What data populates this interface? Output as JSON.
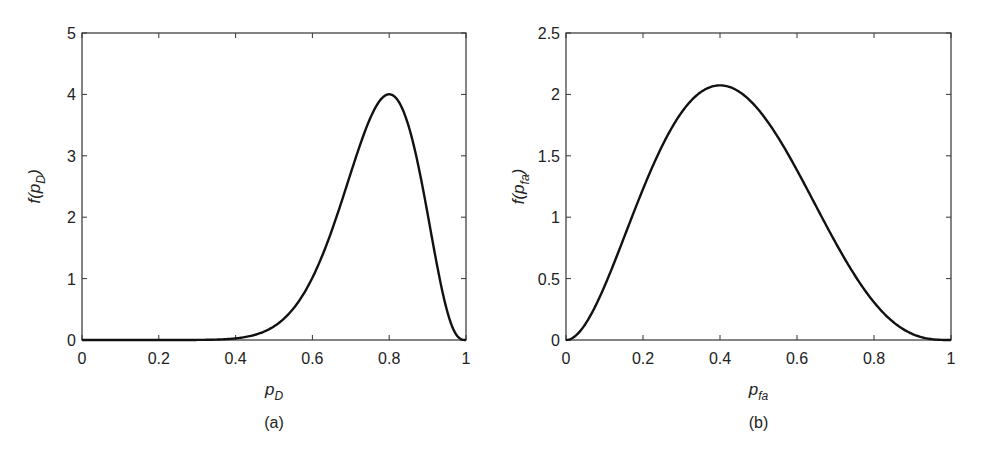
{
  "chart_data": [
    {
      "type": "line",
      "panel_label": "(a)",
      "title": "",
      "xlabel": "p_D",
      "xlabel_main": "p",
      "xlabel_sub": "D",
      "ylabel": "f(p_D)",
      "ylabel_prefix": "f(p",
      "ylabel_sub": "D",
      "ylabel_suffix": ")",
      "xlim": [
        0,
        1
      ],
      "ylim": [
        0,
        5
      ],
      "xticks": [
        0,
        0.2,
        0.4,
        0.6,
        0.8,
        1
      ],
      "xtick_labels": [
        "0",
        "0.2",
        "0.4",
        "0.6",
        "0.8",
        "1"
      ],
      "yticks": [
        0,
        1,
        2,
        3,
        4,
        5
      ],
      "ytick_labels": [
        "0",
        "1",
        "2",
        "3",
        "4",
        "5"
      ],
      "grid": false,
      "legend": null,
      "series": [
        {
          "name": "Beta(13,4) pdf",
          "distribution": {
            "family": "beta",
            "alpha": 13,
            "beta": 4
          },
          "x": [
            0,
            0.1,
            0.2,
            0.3,
            0.4,
            0.45,
            0.5,
            0.55,
            0.6,
            0.65,
            0.7,
            0.75,
            0.8,
            0.85,
            0.9,
            0.95,
            1.0
          ],
          "values": [
            0,
            0.0,
            0.0,
            0.0,
            0.05,
            0.12,
            0.27,
            0.53,
            0.96,
            1.61,
            2.42,
            3.27,
            4.0,
            4.2,
            3.0,
            1.08,
            0
          ]
        }
      ],
      "annotations": {
        "peak": {
          "x": 0.8,
          "y": 4.0
        }
      }
    },
    {
      "type": "line",
      "panel_label": "(b)",
      "title": "",
      "xlabel": "p_fa",
      "xlabel_main": "p",
      "xlabel_sub": "fa",
      "ylabel": "f(p_fa)",
      "ylabel_prefix": "f(p",
      "ylabel_sub": "fa",
      "ylabel_suffix": ")",
      "xlim": [
        0,
        1
      ],
      "ylim": [
        0,
        2.5
      ],
      "xticks": [
        0,
        0.2,
        0.4,
        0.6,
        0.8,
        1
      ],
      "xtick_labels": [
        "0",
        "0.2",
        "0.4",
        "0.6",
        "0.8",
        "1"
      ],
      "yticks": [
        0,
        0.5,
        1,
        1.5,
        2,
        2.5
      ],
      "ytick_labels": [
        "0",
        "0.5",
        "1",
        "1.5",
        "2",
        "2.5"
      ],
      "grid": false,
      "legend": null,
      "series": [
        {
          "name": "Beta(3,4) pdf",
          "distribution": {
            "family": "beta",
            "alpha": 3,
            "beta": 4
          },
          "x": [
            0,
            0.1,
            0.2,
            0.3,
            0.4,
            0.5,
            0.6,
            0.7,
            0.8,
            0.9,
            1.0
          ],
          "values": [
            0,
            0.44,
            1.23,
            1.85,
            2.07,
            1.88,
            1.38,
            0.79,
            0.31,
            0.05,
            0
          ]
        }
      ],
      "annotations": {
        "peak": {
          "x": 0.4,
          "y": 2.07
        }
      }
    }
  ],
  "layout": {
    "panels": [
      {
        "plot_left": 82,
        "plot_top": 33,
        "plot_right": 466,
        "plot_bottom": 340
      },
      {
        "plot_left": 566,
        "plot_top": 33,
        "plot_right": 951,
        "plot_bottom": 340
      }
    ],
    "line_color": "#111111",
    "frame_color": "#333333"
  }
}
